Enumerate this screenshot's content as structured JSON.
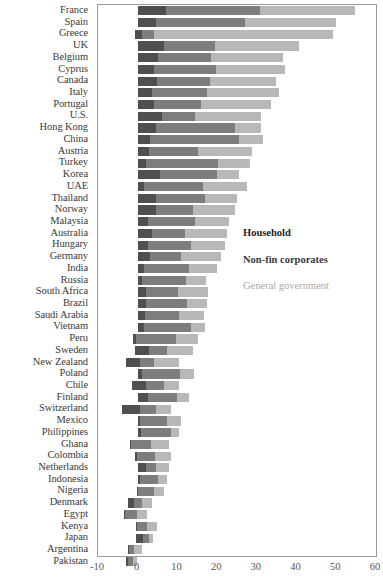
{
  "chart_data": {
    "type": "bar",
    "orientation": "horizontal",
    "stacked": true,
    "title": "",
    "subtitle": "",
    "xlabel": "",
    "ylabel": "",
    "xlim": [
      -10,
      60
    ],
    "xticks": [
      -10,
      0,
      10,
      20,
      30,
      40,
      50,
      60
    ],
    "grid": false,
    "legend_position": "center-right",
    "series": [
      {
        "name": "Household",
        "color": "#4f4f4f"
      },
      {
        "name": "Non-fin corporates",
        "color": "#7d7d7d"
      },
      {
        "name": "General government",
        "color": "#b8b8b8"
      }
    ],
    "categories": [
      "France",
      "Spain",
      "Greece",
      "UK",
      "Belgium",
      "Cyprus",
      "Canada",
      "Italy",
      "Portugal",
      "U.S.",
      "Hong Kong",
      "China",
      "Austria",
      "Turkey",
      "Korea",
      "UAE",
      "Thailand",
      "Norway",
      "Malaysia",
      "Australia",
      "Hungary",
      "Germany",
      "India",
      "Russia",
      "South Africa",
      "Brazil",
      "Saudi Arabia",
      "Vietnam",
      "Peru",
      "Sweden",
      "New Zealand",
      "Poland",
      "Chile",
      "Finland",
      "Switzerland",
      "Mexico",
      "Philippines",
      "Ghana",
      "Colombia",
      "Netherlands",
      "Indonesia",
      "Nigeria",
      "Denmark",
      "Egypt",
      "Kenya",
      "Japan",
      "Argentina",
      "Pakistan"
    ],
    "values": {
      "Household": [
        7.2,
        4.5,
        1.8,
        6.5,
        5.0,
        4.2,
        4.8,
        3.5,
        4.0,
        6.0,
        4.5,
        3.0,
        2.8,
        2.2,
        5.5,
        1.5,
        4.5,
        4.5,
        2.5,
        3.5,
        2.5,
        3.0,
        1.5,
        1.2,
        2.2,
        2.0,
        1.8,
        1.5,
        0.8,
        3.5,
        3.5,
        1.2,
        3.5,
        2.5,
        4.5,
        0.5,
        0.8,
        0.4,
        0.6,
        2.0,
        0.5,
        0.3,
        1.5,
        0.3,
        0.4,
        1.8,
        0.4,
        0.5
      ],
      "Non-fin corporates": [
        23.5,
        22.5,
        3.2,
        13.0,
        13.5,
        15.5,
        13.5,
        14.0,
        12.0,
        8.5,
        20.0,
        22.5,
        12.5,
        18.0,
        14.5,
        15.0,
        12.5,
        9.5,
        12.0,
        8.5,
        11.0,
        8.0,
        11.5,
        11.0,
        8.0,
        10.5,
        8.5,
        12.0,
        10.0,
        4.5,
        3.5,
        9.5,
        4.5,
        7.5,
        4.0,
        7.0,
        7.5,
        5.0,
        4.5,
        2.5,
        4.5,
        4.0,
        2.0,
        3.0,
        2.5,
        1.5,
        1.2,
        1.2
      ],
      "General government": [
        24.0,
        23.0,
        45.0,
        21.0,
        18.0,
        17.5,
        16.5,
        18.0,
        17.5,
        16.5,
        6.5,
        6.0,
        13.5,
        8.0,
        5.5,
        11.0,
        8.0,
        10.5,
        8.5,
        10.5,
        8.5,
        10.0,
        7.0,
        5.0,
        7.5,
        5.0,
        6.5,
        3.5,
        5.5,
        6.5,
        6.5,
        3.5,
        4.0,
        3.0,
        4.0,
        3.5,
        2.0,
        4.5,
        4.0,
        3.5,
        2.5,
        2.5,
        2.5,
        2.5,
        2.5,
        1.0,
        2.0,
        1.0
      ]
    },
    "negative_offsets": {
      "Greece": -0.8,
      "Peru": -1.2,
      "New Zealand": -3.0,
      "Chile": -1.5,
      "Switzerland": -4.0,
      "Ghana": -2.0,
      "Colombia": -0.8,
      "Egypt": -3.5,
      "Argentina": -2.5,
      "Pakistan": -3.0,
      "Sweden": -0.6,
      "Denmark": -2.5,
      "Kenya": -0.5,
      "Japan": -0.4,
      "Nigeria": -0.3
    }
  },
  "legend": {
    "items": [
      {
        "label": "Household",
        "color": "#4f4f4f"
      },
      {
        "label": "Non-fin corporates",
        "color": "#7d7d7d"
      },
      {
        "label": "General government",
        "color": "#b8b8b8"
      }
    ]
  },
  "axis": {
    "ticks": [
      "-10",
      "0",
      "10",
      "20",
      "30",
      "40",
      "50",
      "60"
    ]
  }
}
